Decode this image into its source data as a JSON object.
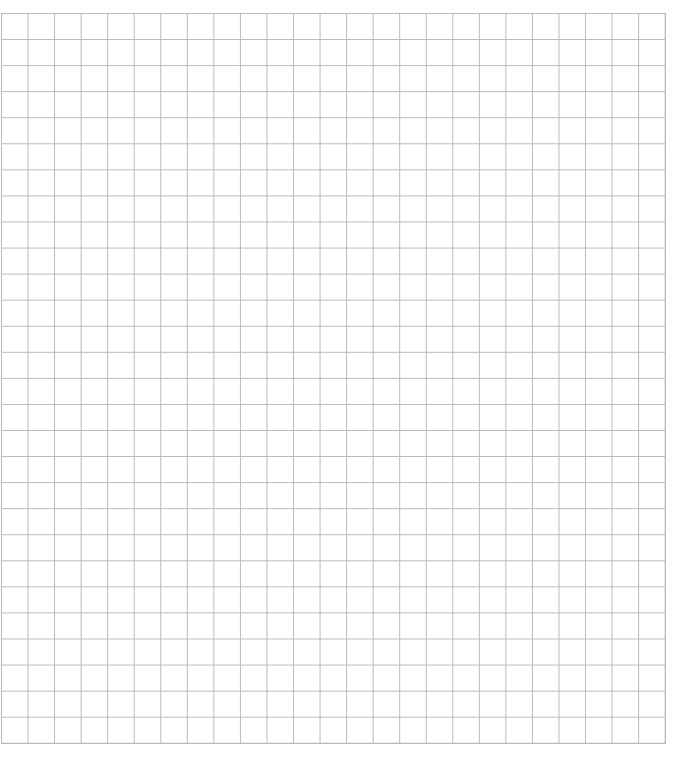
{
  "page": {
    "kind": "graph-paper",
    "background_color": "#ffffff",
    "width_px": 681,
    "height_px": 763
  },
  "grid": {
    "name": "square-grid",
    "columns": 25,
    "rows": 28,
    "cell_width_px": 26.56,
    "cell_height_px": 26.07,
    "line_color": "#b9b9b9",
    "line_width_px": 1,
    "line_style": "solid",
    "major_lines": false,
    "origin_x_px": 1,
    "origin_y_px": 13,
    "end_x_px": 665,
    "end_y_px": 743,
    "labels": [],
    "annotations": []
  },
  "chart_data": {
    "type": "table",
    "title": "",
    "xlabel": "",
    "ylabel": "",
    "categories": [],
    "values": [],
    "grid": true,
    "legend": "none",
    "note": "Empty graph-paper grid: no plotted data, no tick labels, no legend."
  }
}
